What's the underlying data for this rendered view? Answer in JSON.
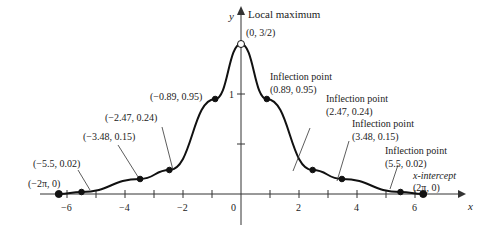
{
  "chart_data": {
    "type": "line",
    "title": "",
    "xlabel": "x",
    "ylabel": "y",
    "xlim": [
      -6.5,
      7.2
    ],
    "ylim": [
      0,
      1.6
    ],
    "x_ticks": [
      -6,
      -5,
      -4,
      -3,
      -2,
      -1,
      0,
      1,
      2,
      3,
      4,
      5,
      6
    ],
    "x_tick_labels": [
      "-6",
      "-4",
      "-2",
      "0",
      "2",
      "4",
      "6"
    ],
    "y_ticks": [
      0.5,
      1
    ],
    "y_tick_labels": [
      "1"
    ],
    "series": [
      {
        "name": "f(x)",
        "domain": [
          -6.283,
          6.283
        ]
      }
    ],
    "points": [
      {
        "x": 0,
        "y": 1.5,
        "label": "(0, 3/2)",
        "note": "Local maximum",
        "open": true
      },
      {
        "x": 0.89,
        "y": 0.95,
        "label": "(0.89, 0.95)",
        "note": "Inflection point"
      },
      {
        "x": -0.89,
        "y": 0.95,
        "label": "(-0.89, 0.95)"
      },
      {
        "x": 2.47,
        "y": 0.24,
        "label": "(2.47, 0.24)",
        "note": "Inflection point"
      },
      {
        "x": -2.47,
        "y": 0.24,
        "label": "(-2.47, 0.24)"
      },
      {
        "x": 3.48,
        "y": 0.15,
        "label": "(3.48, 0.15)",
        "note": "Inflection point"
      },
      {
        "x": -3.48,
        "y": 0.15,
        "label": "(-3.48, 0.15)"
      },
      {
        "x": 5.5,
        "y": 0.02,
        "label": "(5.5, 0.02)",
        "note": "Inflection point"
      },
      {
        "x": -5.5,
        "y": 0.02,
        "label": "(-5.5, 0.02)"
      },
      {
        "x": 6.283,
        "y": 0,
        "label": "(2π, 0)",
        "note": "x-intercept"
      },
      {
        "x": -6.283,
        "y": 0,
        "label": "(-2π, 0)"
      }
    ]
  },
  "labels": {
    "y_axis": "y",
    "x_axis": "x",
    "local_max": "Local maximum",
    "max_coord": "(0, 3/2)",
    "infl": "Inflection point",
    "xint": "x-intercept",
    "p089": "(0.89, 0.95)",
    "m089": "(−0.89, 0.95)",
    "p247": "(2.47, 0.24)",
    "m247": "(−2.47, 0.24)",
    "p348": "(3.48, 0.15)",
    "m348": "(−3.48, 0.15)",
    "p55": "(5.5, 0.02)",
    "m55": "(−5.5, 0.02)",
    "p2pi": "(2π, 0)",
    "m2pi": "(−2π, 0)",
    "t_m6": "−6",
    "t_m4": "−4",
    "t_m2": "−2",
    "t_0": "0",
    "t_2": "2",
    "t_4": "4",
    "t_6": "6",
    "t_y1": "1"
  }
}
